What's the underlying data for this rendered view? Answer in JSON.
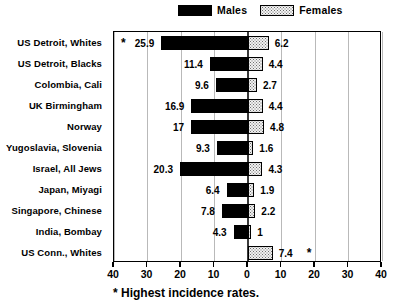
{
  "legend": {
    "males_label": "Males",
    "females_label": "Females",
    "males_swatch": "solid-black-swatch",
    "females_swatch": "stippled-swatch"
  },
  "footnote": {
    "marker": "*",
    "text": "Highest incidence rates."
  },
  "axis": {
    "ticks": [
      "40",
      "30",
      "20",
      "10",
      "0",
      "10",
      "20",
      "30",
      "40"
    ],
    "tick_values": [
      -40,
      -30,
      -20,
      -10,
      0,
      10,
      20,
      30,
      40
    ],
    "min": -40,
    "max": 40
  },
  "colors": {
    "males": "#000000",
    "females_fill": "#f0f0f0",
    "females_dots": "#707070",
    "frame": "#000000",
    "grid": "#b9b9b9"
  },
  "chart_data": {
    "type": "bar",
    "orientation": "horizontal-diverging",
    "title": "",
    "subtitle": "",
    "xlabel": "",
    "ylabel": "",
    "xlim": [
      -40,
      40
    ],
    "xticks": [
      40,
      30,
      20,
      10,
      0,
      10,
      20,
      30,
      40
    ],
    "grid": true,
    "legend_position": "top",
    "categories": [
      "US Detroit, Whites",
      "US Detroit, Blacks",
      "Colombia, Cali",
      "UK Birmingham",
      "Norway",
      "Yugoslavia, Slovenia",
      "Israel, All Jews",
      "Japan, Miyagi",
      "Singapore, Chinese",
      "India, Bombay",
      "US Conn., Whites"
    ],
    "series": [
      {
        "name": "Males",
        "direction": "left",
        "values": [
          25.9,
          11.4,
          9.6,
          16.9,
          17,
          9.3,
          20.3,
          6.4,
          7.8,
          4.3,
          0
        ],
        "labels": [
          "25.9",
          "11.4",
          "9.6",
          "16.9",
          "17",
          "9.3",
          "20.3",
          "6.4",
          "7.8",
          "4.3",
          ""
        ],
        "highlighted": [
          true,
          false,
          false,
          false,
          false,
          false,
          false,
          false,
          false,
          false,
          false
        ]
      },
      {
        "name": "Females",
        "direction": "right",
        "values": [
          6.2,
          4.4,
          2.7,
          4.4,
          4.8,
          1.6,
          4.3,
          1.9,
          2.2,
          1,
          7.4
        ],
        "labels": [
          "6.2",
          "4.4",
          "2.7",
          "4.4",
          "4.8",
          "1.6",
          "4.3",
          "1.9",
          "2.2",
          "1",
          "7.4"
        ],
        "highlighted": [
          false,
          false,
          false,
          false,
          false,
          false,
          false,
          false,
          false,
          false,
          true
        ]
      }
    ],
    "annotations": [
      {
        "marker": "*",
        "row": "US Detroit, Whites",
        "side": "left",
        "note": "highest male incidence"
      },
      {
        "marker": "*",
        "row": "US Conn., Whites",
        "side": "right",
        "note": "highest female incidence"
      }
    ]
  }
}
